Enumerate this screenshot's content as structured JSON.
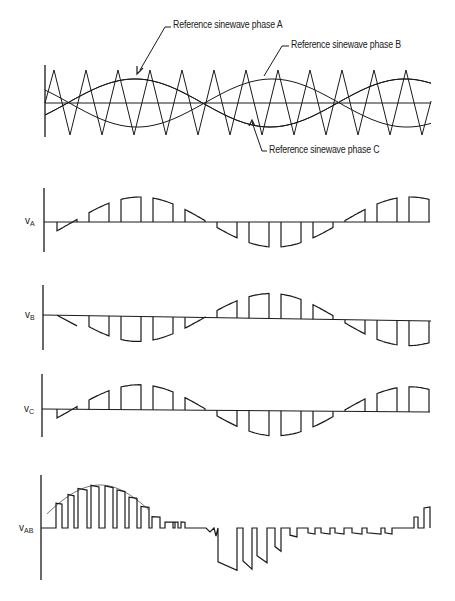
{
  "figure": {
    "carrier_panel": {
      "annotations": [
        {
          "text": "Reference sinewave phase A",
          "x": 173,
          "y": 19
        },
        {
          "text": "Reference sinewave phase B",
          "x": 291,
          "y": 39
        },
        {
          "text": "Reference sinewave phase C",
          "x": 269,
          "y": 144
        }
      ]
    },
    "waveform_labels": {
      "vA": {
        "main": "v",
        "sub": "A"
      },
      "vB": {
        "main": "v",
        "sub": "B"
      },
      "vC": {
        "main": "v",
        "sub": "C"
      },
      "vAB": {
        "main": "v",
        "sub": "AB"
      }
    },
    "colors": {
      "ink": "#1a1a1a",
      "background": "#ffffff"
    }
  },
  "chart_data": {
    "type": "line",
    "panels": [
      {
        "name": "carrier_and_references",
        "series": [
          {
            "name": "Triangular carrier",
            "shape": "triangle",
            "cycles": 12,
            "amplitude": 1.0
          },
          {
            "name": "Reference sinewave phase A",
            "shape": "sine",
            "amplitude": 0.72,
            "phase_deg": 0
          },
          {
            "name": "Reference sinewave phase B",
            "shape": "sine",
            "amplitude": 0.72,
            "phase_deg": -120
          },
          {
            "name": "Reference sinewave phase C",
            "shape": "sine",
            "amplitude": 0.72,
            "phase_deg": 120
          }
        ]
      },
      {
        "name": "vA",
        "ylabel": "vA",
        "description": "PWM pulses following phase A reference"
      },
      {
        "name": "vB",
        "ylabel": "vB",
        "description": "PWM pulses following phase B reference"
      },
      {
        "name": "vC",
        "ylabel": "vC",
        "description": "PWM pulses following phase C reference"
      },
      {
        "name": "vAB",
        "ylabel": "vAB",
        "description": "Line-to-line voltage vA - vB with sinusoidal envelope"
      }
    ],
    "xlabel": "",
    "grid": false,
    "legend": "callout annotations"
  }
}
